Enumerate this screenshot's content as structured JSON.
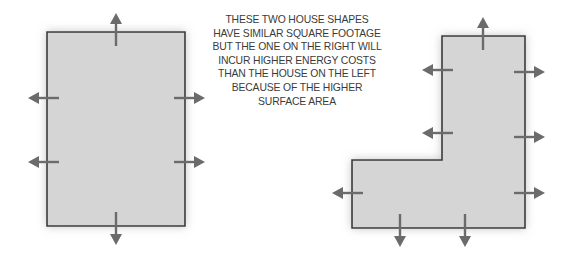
{
  "figure": {
    "background_color": "#ffffff"
  },
  "caption": {
    "lines": [
      "THESE TWO HOUSE SHAPES",
      "HAVE SIMILAR SQUARE FOOTAGE",
      "BUT THE ONE ON THE RIGHT WILL",
      "INCUR HIGHER ENERGY COSTS",
      "THAN THE HOUSE ON THE LEFT",
      "BECAUSE OF THE HIGHER",
      "SURFACE AREA"
    ],
    "text_color": "#3b3b3b"
  },
  "shapes": {
    "fill_color": "#d5d5d5",
    "stroke_color": "#3a3a3a",
    "arrow_color": "#6b6b6b",
    "left": {
      "label": "rectangular-house-shape",
      "name": "Simple rectangle house",
      "points": "47,32 185,32 185,226 47,226",
      "arrow_count": 6
    },
    "right": {
      "label": "l-shaped-house-shape",
      "name": "L-shaped house",
      "points": "442,36 525,36 525,228 352,228 352,160 442,160",
      "arrow_count": 9
    }
  },
  "arrows": {
    "left_shape": [
      {
        "name": "arrow-top",
        "direction": "up",
        "x1": 116,
        "y1": 46,
        "x2": 116,
        "y2": 13
      },
      {
        "name": "arrow-left-upper",
        "direction": "left",
        "x1": 59,
        "y1": 98,
        "x2": 28,
        "y2": 98
      },
      {
        "name": "arrow-left-lower",
        "direction": "left",
        "x1": 59,
        "y1": 162,
        "x2": 28,
        "y2": 162
      },
      {
        "name": "arrow-right-upper",
        "direction": "right",
        "x1": 174,
        "y1": 98,
        "x2": 205,
        "y2": 98
      },
      {
        "name": "arrow-right-lower",
        "direction": "right",
        "x1": 174,
        "y1": 162,
        "x2": 205,
        "y2": 162
      },
      {
        "name": "arrow-bottom",
        "direction": "down",
        "x1": 116,
        "y1": 212,
        "x2": 116,
        "y2": 245
      }
    ],
    "right_shape": [
      {
        "name": "arrow-top",
        "direction": "up",
        "x1": 483,
        "y1": 50,
        "x2": 483,
        "y2": 17
      },
      {
        "name": "arrow-left-upper",
        "direction": "left",
        "x1": 453,
        "y1": 70,
        "x2": 422,
        "y2": 70
      },
      {
        "name": "arrow-left-middle",
        "direction": "left",
        "x1": 453,
        "y1": 133,
        "x2": 422,
        "y2": 133
      },
      {
        "name": "arrow-left-foot",
        "direction": "left",
        "x1": 363,
        "y1": 193,
        "x2": 332,
        "y2": 193
      },
      {
        "name": "arrow-right-upper",
        "direction": "right",
        "x1": 514,
        "y1": 72,
        "x2": 545,
        "y2": 72
      },
      {
        "name": "arrow-right-middle",
        "direction": "right",
        "x1": 514,
        "y1": 137,
        "x2": 545,
        "y2": 137
      },
      {
        "name": "arrow-right-lower",
        "direction": "right",
        "x1": 514,
        "y1": 193,
        "x2": 545,
        "y2": 193
      },
      {
        "name": "arrow-bottom-left",
        "direction": "down",
        "x1": 400,
        "y1": 214,
        "x2": 400,
        "y2": 247
      },
      {
        "name": "arrow-bottom-right",
        "direction": "down",
        "x1": 465,
        "y1": 214,
        "x2": 465,
        "y2": 247
      }
    ]
  }
}
